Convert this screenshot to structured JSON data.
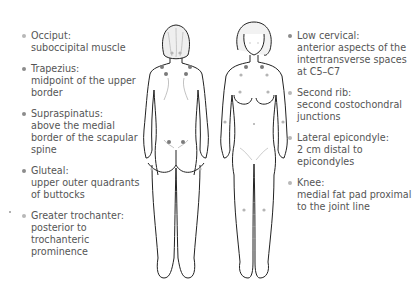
{
  "colors": {
    "outline": "#222222",
    "tender_point": "#7a7a7a",
    "tender_point_light": "#b5b5b5",
    "text": "#555555",
    "hair": "#d8d8d8"
  },
  "left_labels": [
    {
      "label": "Occiput:",
      "desc": "suboccipital muscle",
      "bullet": "light"
    },
    {
      "label": "Trapezius:",
      "desc": "midpoint of the upper border",
      "bullet": "dark"
    },
    {
      "label": "Supraspinatus:",
      "desc": "above the medial border of the scapular spine",
      "bullet": "dark"
    },
    {
      "label": "Gluteal:",
      "desc": "upper outer quadrants of buttocks",
      "bullet": "dark"
    },
    {
      "label": "Greater trochanter:",
      "desc": "posterior to trochanteric prominence",
      "bullet": "light"
    }
  ],
  "right_labels": [
    {
      "label": "Low cervical:",
      "desc": "anterior aspects of the intertransverse spaces at C5–C7",
      "bullet": "dark"
    },
    {
      "label": "Second rib:",
      "desc": "second costochondral junctions",
      "bullet": "light"
    },
    {
      "label": "Lateral epicondyle:",
      "desc": "2 cm distal to epicondyles",
      "bullet": "light"
    },
    {
      "label": "Knee:",
      "desc": "medial fat pad proximal to the joint line",
      "bullet": "light"
    }
  ],
  "figures": {
    "back": "posterior-view-figure",
    "front": "anterior-view-figure"
  }
}
